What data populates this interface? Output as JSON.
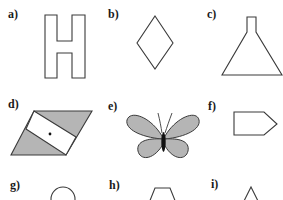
{
  "colors": {
    "stroke": "#3a3a3a",
    "fill_gray": "#b5b5b5",
    "background": "#ffffff"
  },
  "figures": [
    {
      "id": "a",
      "label": "a)",
      "shape": "letter-H-outline"
    },
    {
      "id": "b",
      "label": "b)",
      "shape": "diamond"
    },
    {
      "id": "c",
      "label": "c)",
      "shape": "flask"
    },
    {
      "id": "d",
      "label": "d)",
      "shape": "parallelogram-with-band-and-dot"
    },
    {
      "id": "e",
      "label": "e)",
      "shape": "butterfly"
    },
    {
      "id": "f",
      "label": "f)",
      "shape": "pentagon-arrow"
    },
    {
      "id": "g",
      "label": "g)",
      "shape": "circle"
    },
    {
      "id": "h",
      "label": "h)",
      "shape": "trapezoid"
    },
    {
      "id": "i",
      "label": "i)",
      "shape": "triangle"
    }
  ]
}
